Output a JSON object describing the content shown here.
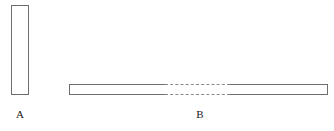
{
  "figure": {
    "type": "line-diagram",
    "background_color": "#ffffff",
    "stroke_color": "#6e6e6e",
    "dash_color": "#8a8a8a",
    "label_color": "#1a1a1a",
    "shapes": [
      {
        "id": "A",
        "label": "A",
        "form": "rectangle",
        "orientation": "vertical",
        "filled": false,
        "x": 11,
        "y": 5,
        "width": 18,
        "height": 90,
        "broken": false
      },
      {
        "id": "B",
        "label": "B",
        "form": "rectangle",
        "orientation": "horizontal",
        "filled": false,
        "x": 69,
        "y": 84,
        "width": 259,
        "height": 11,
        "broken": true,
        "break_start": 96,
        "break_width": 65,
        "break_style": "dashed"
      }
    ],
    "labels": {
      "a": "A",
      "b": "B"
    }
  }
}
